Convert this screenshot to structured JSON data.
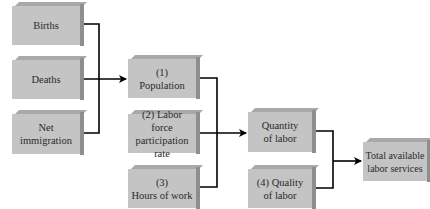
{
  "diagram": {
    "colors": {
      "box_front": "#c4c4c4",
      "box_top": "#a9a9a9",
      "box_side": "#8e8e8e",
      "line": "#000000",
      "text": "#2a2a2a"
    },
    "boxes": {
      "births": {
        "label": "Births"
      },
      "deaths": {
        "label": "Deaths"
      },
      "net_immigration": {
        "line1": "Net",
        "line2": "immigration"
      },
      "population": {
        "line1": "(1)",
        "line2": "Population"
      },
      "participation": {
        "line1": "(2) Labor force",
        "line2": "participation",
        "line3": "rate"
      },
      "hours": {
        "line1": "(3)",
        "line2": "Hours of work"
      },
      "quantity": {
        "line1": "Quantity",
        "line2": "of labor"
      },
      "quality": {
        "line1": "(4) Quality",
        "line2": "of labor"
      },
      "total": {
        "line1": "Total available",
        "line2": "labor services"
      }
    },
    "edges": [
      {
        "from": [
          "births",
          "deaths",
          "net_immigration"
        ],
        "to": "population"
      },
      {
        "from": [
          "population",
          "participation",
          "hours"
        ],
        "to": "quantity"
      },
      {
        "from": [
          "quantity",
          "quality"
        ],
        "to": "total"
      }
    ]
  }
}
